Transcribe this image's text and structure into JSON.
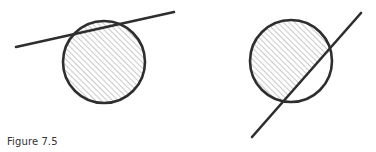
{
  "caption": "Figure 7.5",
  "colors": {
    "stroke": "#2e2e2e",
    "hatch": "#8a8a8a",
    "background": "#ffffff",
    "caption": "#333333"
  },
  "panels": [
    {
      "name": "left",
      "description": "Line crossing circle near the top; circle fully hatched",
      "circle": {
        "cx": 104,
        "cy": 62,
        "r": 41
      },
      "line": {
        "x1": 16,
        "y1": 47,
        "x2": 174,
        "y2": 12
      },
      "hatched_region": "entire circle"
    },
    {
      "name": "right",
      "description": "Diagonal line cutting circle; region upper-left of line hatched",
      "circle": {
        "cx": 291,
        "cy": 61,
        "r": 41
      },
      "line": {
        "x1": 252,
        "y1": 137,
        "x2": 361,
        "y2": 13
      },
      "hatched_region": "circle segment above/left of line"
    }
  ]
}
